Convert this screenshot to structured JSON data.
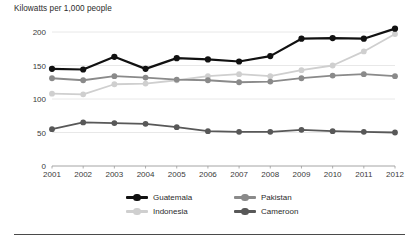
{
  "figure": {
    "axis_title": "Kilowatts per 1,000 people",
    "background": "#ffffff",
    "grid_color": "#e2e2e2",
    "axis_color": "#9a9a9a",
    "rule_color": "#4a4a4a"
  },
  "chart_data": {
    "type": "line",
    "title": "",
    "subtitle": "",
    "xlabel": "",
    "ylabel": "Kilowatts per 1,000 people",
    "x": [
      2001,
      2002,
      2003,
      2004,
      2005,
      2006,
      2007,
      2008,
      2009,
      2010,
      2011,
      2012
    ],
    "categories": [
      "2001",
      "2002",
      "2003",
      "2004",
      "2005",
      "2006",
      "2007",
      "2008",
      "2009",
      "2010",
      "2011",
      "2012"
    ],
    "xlim": [
      2001,
      2012
    ],
    "ylim": [
      0,
      200
    ],
    "yticks": [
      0,
      50,
      100,
      150,
      200
    ],
    "ytick_labels": [
      "0",
      "50",
      "100",
      "150",
      "200"
    ],
    "grid": "horizontal",
    "legend_position": "bottom-center",
    "markers": "circle",
    "series": [
      {
        "name": "Guatemala",
        "color": "#111111",
        "values": [
          145,
          144,
          163,
          145,
          161,
          159,
          156,
          164,
          190,
          191,
          190,
          205
        ]
      },
      {
        "name": "Indonesia",
        "color": "#cfcfcf",
        "values": [
          108,
          107,
          122,
          123,
          128,
          134,
          137,
          134,
          143,
          150,
          171,
          197
        ]
      },
      {
        "name": "Pakistan",
        "color": "#8a8a8a",
        "values": [
          131,
          128,
          134,
          132,
          129,
          128,
          125,
          126,
          131,
          135,
          137,
          134
        ]
      },
      {
        "name": "Cameroon",
        "color": "#585858",
        "values": [
          55,
          65,
          64,
          63,
          58,
          52,
          51,
          51,
          54,
          52,
          51,
          50
        ]
      }
    ]
  },
  "legend": {
    "items": [
      {
        "label": "Guatemala",
        "color": "#111111"
      },
      {
        "label": "Pakistan",
        "color": "#8a8a8a"
      },
      {
        "label": "Indonesia",
        "color": "#cfcfcf"
      },
      {
        "label": "Cameroon",
        "color": "#585858"
      }
    ]
  }
}
